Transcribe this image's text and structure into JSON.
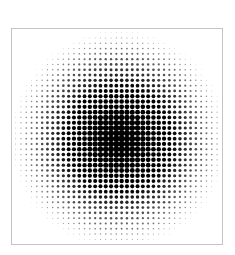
{
  "image": {
    "subject": "halftone-radial-gradient",
    "description": "Circular halftone dot pattern, dense black at center fading to small dots at edges",
    "frame": {
      "border_color": "#c4c4c4",
      "background": "#ffffff"
    },
    "halftone": {
      "dot_color": "#000000",
      "pitch": 5.3,
      "center_x": 107,
      "center_y": 110,
      "radius": 108,
      "max_dot_diameter": 6.4,
      "min_dot_diameter": 0.6
    }
  }
}
